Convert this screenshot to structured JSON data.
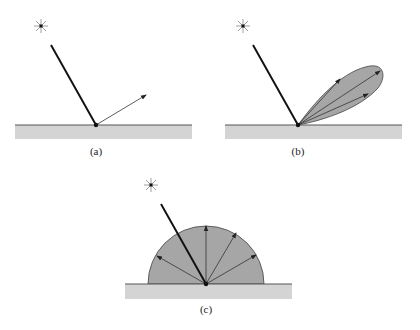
{
  "figure": {
    "colors": {
      "ground_fill": "#d4d4d4",
      "surface_line": "#555555",
      "lobe_fill": "#a6a6a6",
      "lobe_stroke": "#444444",
      "incident_ray": "#111111",
      "reflected_ray": "#333333",
      "light_source": "#111111"
    },
    "panels": [
      {
        "id": "a",
        "label": "(a)",
        "type": "specular",
        "light_icon": "light-source-star-icon",
        "reflected_rays": 1
      },
      {
        "id": "b",
        "label": "(b)",
        "type": "glossy",
        "light_icon": "light-source-star-icon",
        "reflected_rays": 3
      },
      {
        "id": "c",
        "label": "(c)",
        "type": "diffuse",
        "light_icon": "light-source-star-icon",
        "reflected_rays": 5
      }
    ]
  }
}
